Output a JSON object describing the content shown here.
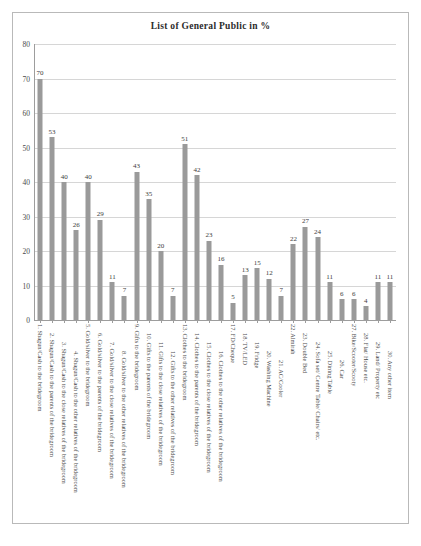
{
  "chart_data": {
    "type": "bar",
    "title": "List of General Public in %",
    "xlabel": "",
    "ylabel": "",
    "ylim": [
      0,
      80
    ],
    "yticks": [
      0,
      10,
      20,
      30,
      40,
      50,
      60,
      70,
      80
    ],
    "grid": true,
    "legend": false,
    "bar_color": "#9a9a9a",
    "categories": [
      "1.   Shagun/Cash to the bridegroom",
      "2.   Shagun/Cash to the parents of the bridegroom",
      "3.   Shagun/Cash to the close relatives of the bridegroom",
      "4.   Shagun/Cash to the other relatives of the bridegroom",
      "5.   Gold/silver to the bridegroom",
      "6.   Gold/silver to the parents of the bridegroom",
      "7.   Gold/silver to the close relatives of the bridegroom",
      "8.   Gold/silver to the other relatives of the bridegroom",
      "9.   Gifts to the bridegroom",
      "10. Gifts to the parents of the bridegroom",
      "11. Gifts to the close relatives of the bridegroom",
      "12. Gifts to the other relatives of the bridegroom",
      "13. Clothes to the bridegroom",
      "14. Clothes to the parents of the bridegroom",
      "15. Clothes to the close relatives of the bridegroom",
      "16. Clothes to the other relatives of the bridegroom",
      "17. FD/Cheque",
      "18. TV/LED",
      "19. Fridge",
      "20. Washing Machine",
      "21. AC/Cooler",
      "22. Almirah",
      "23. Double Bed",
      "24. Sofa set/ Centre Table/ Chairs/ etc.",
      "25. Dining Table",
      "26. Car",
      "27. Bike/Scooter/Scooty",
      "28. Flat/ House etc.",
      "29. Land/ Property etc",
      "30. Any other item"
    ],
    "values": [
      70,
      53,
      40,
      26,
      40,
      29,
      11,
      7,
      43,
      35,
      20,
      7,
      51,
      42,
      23,
      16,
      5,
      13,
      15,
      12,
      7,
      22,
      27,
      24,
      11,
      6,
      6,
      4,
      11,
      11
    ]
  }
}
